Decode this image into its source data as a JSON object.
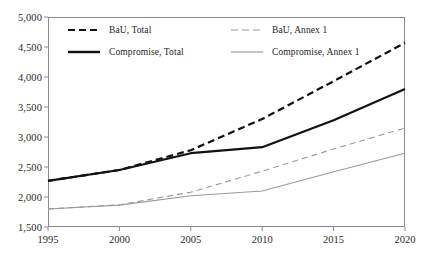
{
  "chart_data": {
    "type": "line",
    "title": "",
    "xlabel": "",
    "ylabel": "",
    "xlim": [
      1995,
      2020
    ],
    "ylim": [
      1500,
      5000
    ],
    "grid": false,
    "legend_position": "top-left-inside",
    "x": [
      1995,
      2000,
      2005,
      2010,
      2015,
      2020
    ],
    "xticklabels": [
      "1995",
      "2000",
      "2005",
      "2010",
      "2015",
      "2020"
    ],
    "yticks": [
      1500,
      2000,
      2500,
      3000,
      3500,
      4000,
      4500,
      5000
    ],
    "yticklabels": [
      "1,500",
      "2,000",
      "2,500",
      "3,000",
      "3,500",
      "4,000",
      "4,500",
      "5,000"
    ],
    "series": [
      {
        "name": "BaU, Total",
        "style": "dashed",
        "color": "#111111",
        "width": 2.2,
        "values": [
          2270,
          2450,
          2780,
          3300,
          3930,
          4570
        ]
      },
      {
        "name": "BaU, Annex 1",
        "style": "dashed",
        "color": "#9a9a9a",
        "width": 1.1,
        "values": [
          1800,
          1870,
          2080,
          2430,
          2800,
          3150
        ]
      },
      {
        "name": "Compromise, Total",
        "style": "solid",
        "color": "#111111",
        "width": 2.2,
        "values": [
          2270,
          2450,
          2730,
          2830,
          3280,
          3800
        ]
      },
      {
        "name": "Compromise, Annex 1",
        "style": "solid",
        "color": "#9a9a9a",
        "width": 1.1,
        "values": [
          1800,
          1865,
          2020,
          2100,
          2420,
          2730
        ]
      }
    ]
  },
  "legend": {
    "items": [
      {
        "label": "BaU, Total"
      },
      {
        "label": "BaU, Annex 1"
      },
      {
        "label": "Compromise, Total"
      },
      {
        "label": "Compromise, Annex 1"
      }
    ]
  }
}
